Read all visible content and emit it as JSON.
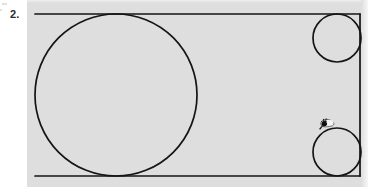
{
  "page": {
    "background_color": "#ffffff",
    "width": 375,
    "height": 187
  },
  "problem": {
    "number_label": "2.",
    "number_color": "#2b2b2b"
  },
  "figure": {
    "panel": {
      "name": "figure-panel",
      "fill_color": "#dedede",
      "x": 27,
      "y": 0,
      "width": 341,
      "height": 187
    },
    "stroke_color": "#141414",
    "stroke_width": 1.7,
    "rectangle": {
      "label": "rectangle",
      "x1": 35,
      "y1": 14,
      "x2": 360,
      "y2": 176,
      "drawn_sides": [
        "top",
        "right",
        "bottom"
      ],
      "left_side_drawn": false
    },
    "large_circle": {
      "label": "large circle",
      "cx": 116,
      "cy": 95,
      "r": 81
    },
    "small_circle_top_right": {
      "label": "small circle top right",
      "cx": 337,
      "cy": 38,
      "r": 24
    },
    "small_circle_bottom_right": {
      "label": "small circle bottom right",
      "cx": 337,
      "cy": 152,
      "r": 24
    },
    "ink_smudge": {
      "label": "ink smudge artifact",
      "cx": 324,
      "cy": 127,
      "color": "#1a1a1a"
    }
  }
}
